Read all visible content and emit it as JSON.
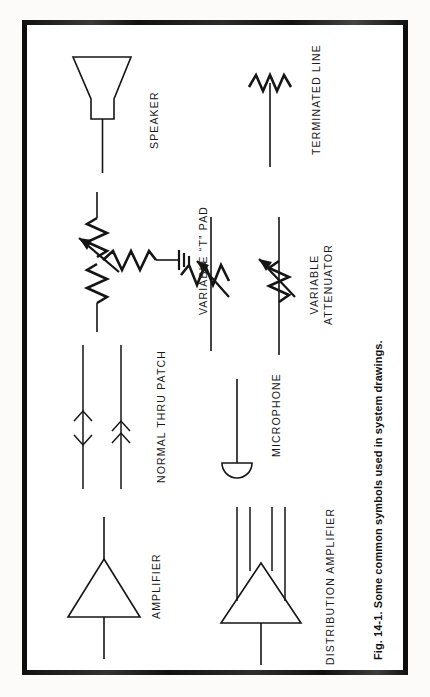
{
  "figure": {
    "caption": "Fig. 14-1. Some common symbols used in system drawings.",
    "border_color": "#0d0d0d",
    "line_color": "#151515",
    "background_color": "#ffffff"
  },
  "symbols": [
    {
      "id": "speaker",
      "label": "SPEAKER",
      "icon": "speaker-horn-icon",
      "description": "Horn trapezoid with lead line"
    },
    {
      "id": "terminated-line",
      "label": "TERMINATED LINE",
      "icon": "resistor-zigzag-icon",
      "description": "Vertical line ending in a zigzag resistor"
    },
    {
      "id": "variable-t-pad",
      "label": "VARIABLE “T” PAD",
      "icon": "variable-t-pad-icon",
      "description": "Two series zigzags with wiper arrow plus shunt zigzag to ground"
    },
    {
      "id": "variable-attenuator-a",
      "label": "",
      "icon": "variable-attenuator-icon",
      "description": "Line crossed by zigzag with diagonal wiper arrow"
    },
    {
      "id": "variable-attenuator",
      "label": "VARIABLE\nATTENUATOR",
      "label_line1": "VARIABLE",
      "label_line2": "ATTENUATOR",
      "icon": "variable-attenuator-icon",
      "description": "In-line zigzag resistor with diagonal wiper arrow"
    },
    {
      "id": "normal-thru-patch",
      "label": "NORMAL THRU PATCH",
      "icon": "patch-arrows-icon",
      "description": "Two vertical lines with chevron arrowheads"
    },
    {
      "id": "microphone",
      "label": "MICROPHONE",
      "icon": "microphone-icon",
      "description": "Flat-topped circle with lead line"
    },
    {
      "id": "amplifier",
      "label": "AMPLIFIER",
      "icon": "amplifier-triangle-icon",
      "description": "Triangle with input and output lines"
    },
    {
      "id": "distribution-amplifier",
      "label": "DISTRIBUTION AMPLIFIER",
      "icon": "distribution-amplifier-icon",
      "description": "Triangle with one input and four output lines"
    }
  ]
}
